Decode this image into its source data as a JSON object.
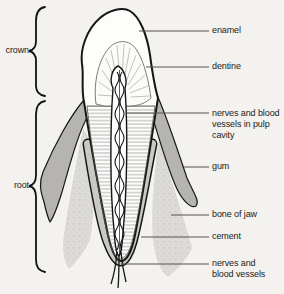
{
  "figure": {
    "type": "anatomical diagram",
    "left_labels": [
      {
        "id": "crown",
        "label": "crown"
      },
      {
        "id": "root",
        "label": "root"
      }
    ],
    "right_labels": [
      {
        "id": "enamel",
        "label": "enamel"
      },
      {
        "id": "dentine",
        "label": "dentine"
      },
      {
        "id": "pulp",
        "label": "nerves and blood\nvessels in pulp\ncavity"
      },
      {
        "id": "gum",
        "label": "gum"
      },
      {
        "id": "bone",
        "label": "bone of jaw"
      },
      {
        "id": "cement",
        "label": "cement"
      },
      {
        "id": "vessels",
        "label": "nerves and\nblood vessels"
      }
    ],
    "colors": {
      "background": "#f3f2ee",
      "gum": "#b5b4b1",
      "bone_of_jaw": "#dcdbd7",
      "cement": "#c9c8c4",
      "tooth": "#fdfdfc",
      "outline": "#161616",
      "leader_line": "#55524e",
      "text": "#1c1b19"
    }
  }
}
